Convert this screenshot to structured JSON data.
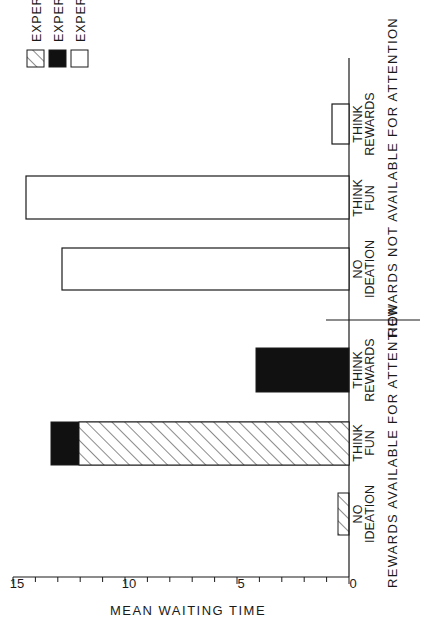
{
  "chart_data": {
    "type": "bar",
    "orientation": "vertical (figure printed rotated 90 degrees counterclockwise)",
    "title": "",
    "xlabel": "",
    "ylabel": "MEAN WAITING TIME",
    "ylim": [
      0,
      15
    ],
    "yticks_labeled": [
      "0",
      "5",
      "10",
      "15"
    ],
    "yticks_minor_step": 1,
    "grid": false,
    "legend_position": "upper right",
    "groups": [
      {
        "label": "REWARDS AVAILABLE FOR ATTENTION",
        "categories": [
          {
            "line1": "NO",
            "line2": "IDEATION"
          },
          {
            "line1": "THINK",
            "line2": "FUN"
          },
          {
            "line1": "THINK",
            "line2": "REWARDS"
          }
        ]
      },
      {
        "label": "REWARDS NOT AVAILABLE FOR ATTENTION",
        "categories": [
          {
            "line1": "NO",
            "line2": "IDEATION"
          },
          {
            "line1": "THINK",
            "line2": "FUN"
          },
          {
            "line1": "THINK",
            "line2": "REWARDS"
          }
        ]
      }
    ],
    "categories": [
      "Available: No Ideation",
      "Available: Think Fun",
      "Available: Think Rewards",
      "Not Available: No Ideation",
      "Not Available: Think Fun",
      "Not Available: Think Rewards"
    ],
    "series": [
      {
        "name": "EXPERIMENT 1",
        "pattern": "hatched",
        "values": [
          0.5,
          12.0,
          null,
          null,
          null,
          null
        ]
      },
      {
        "name": "EXPERIMENT 2",
        "pattern": "solid-black",
        "values": [
          null,
          13.3,
          4.1,
          null,
          null,
          null
        ]
      },
      {
        "name": "EXPERIMENT 3",
        "pattern": "open-white",
        "values": [
          null,
          null,
          null,
          12.8,
          14.4,
          0.8
        ]
      }
    ]
  },
  "legend": {
    "items": [
      {
        "label": "EXPERIMENT I",
        "pattern": "hatched"
      },
      {
        "label": "EXPERIMENT 2",
        "pattern": "solid"
      },
      {
        "label": "EXPERIMENT 3",
        "pattern": "open"
      }
    ]
  },
  "axis": {
    "ylabel": "MEAN WAITING TIME",
    "ticks": [
      "0",
      "5",
      "10",
      "15"
    ]
  },
  "categories": {
    "c1": {
      "line1": "NO",
      "line2": "IDEATION"
    },
    "c2": {
      "line1": "THINK",
      "line2": "FUN"
    },
    "c3": {
      "line1": "THINK",
      "line2": "REWARDS"
    },
    "c4": {
      "line1": "NO",
      "line2": "IDEATION"
    },
    "c5": {
      "line1": "THINK",
      "line2": "FUN"
    },
    "c6": {
      "line1": "THINK",
      "line2": "REWARDS"
    }
  },
  "groups": {
    "g1": "REWARDS AVAILABLE FOR ATTENTION",
    "g2": "REWARDS NOT AVAILABLE FOR ATTENTION"
  },
  "colors": {
    "ink": "#1a1a1a",
    "paper": "#ffffff"
  }
}
